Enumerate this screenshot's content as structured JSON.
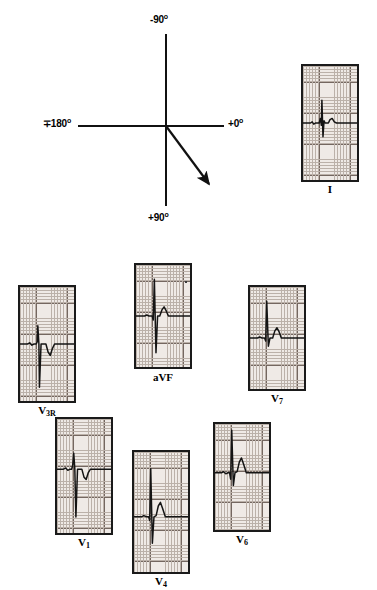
{
  "figure": {
    "type": "ecg-axis-diagram"
  },
  "axis_diagram": {
    "name": "hexaxial-reference-axes",
    "center": {
      "x": 166,
      "y": 126
    },
    "labels": [
      {
        "id": "top",
        "text": "-90",
        "degree_symbol": "o",
        "x": 150,
        "y": 14,
        "name": "axis-label-minus-90"
      },
      {
        "id": "left",
        "text": "∓180",
        "degree_symbol": "o",
        "x": 43,
        "y": 118,
        "name": "axis-label-plus-minus-180"
      },
      {
        "id": "right",
        "text": "+0",
        "degree_symbol": "o",
        "x": 228,
        "y": 118,
        "name": "axis-label-plus-0"
      },
      {
        "id": "bottom",
        "text": "+90",
        "degree_symbol": "o",
        "x": 148,
        "y": 212,
        "name": "axis-label-plus-90"
      }
    ],
    "vertical_axis": {
      "x": 165,
      "y_top": 34,
      "y_bottom": 206
    },
    "horizontal_axis": {
      "y": 125,
      "x_left": 78,
      "x_right": 224
    },
    "vector_arrow": {
      "name": "mean-qrs-axis-vector",
      "from": {
        "x": 166,
        "y": 126
      },
      "to": {
        "x": 214,
        "y": 191
      },
      "approx_degrees": 54
    }
  },
  "strips": [
    {
      "id": "lead-I",
      "label": "I",
      "label_sub": "",
      "box": {
        "x": 301,
        "y": 64,
        "w": 58,
        "h": 118
      },
      "label_pos": {
        "x": 301,
        "y": 183,
        "w": 58
      },
      "baseline_frac": 0.5,
      "morphology": "small-r-small-s, low amplitude, isoelectric",
      "trace": "M0,50 L14,50 L17,49 L20,51 L23,50 L30,50 L32,46 L34,52 L35,30 L37,62 L39,48 L41,50 L47,50 L50,47 L54,46 L58,49 L62,50 L100,50"
    },
    {
      "id": "lead-aVF",
      "label": "aVF",
      "label_sub": "",
      "box": {
        "x": 134,
        "y": 263,
        "w": 58,
        "h": 106
      },
      "label_pos": {
        "x": 134,
        "y": 371,
        "w": 58
      },
      "baseline_frac": 0.5,
      "morphology": "tall R with deep S, qRs pattern",
      "trace": "M0,50 L16,50 L20,49 L24,50 L30,50 L32,54 L34,14 L37,86 L40,50 L44,50 L48,44 L52,41 L56,45 L60,50 L100,50"
    },
    {
      "id": "lead-V3R",
      "label": "V",
      "label_sub": "3R",
      "box": {
        "x": 18,
        "y": 285,
        "w": 58,
        "h": 118
      },
      "label_pos": {
        "x": 18,
        "y": 404,
        "w": 58
      },
      "baseline_frac": 0.5,
      "morphology": "rS pattern with deep narrow S and inverted T",
      "trace": "M0,50 L14,50 L18,49 L22,51 L26,50 L30,50 L32,48 L33,34 L35,50 L36,88 L39,50 L43,50 L48,50 L52,57 L56,60 L60,54 L64,50 L100,50"
    },
    {
      "id": "lead-V7",
      "label": "V",
      "label_sub": "7",
      "box": {
        "x": 248,
        "y": 285,
        "w": 58,
        "h": 106
      },
      "label_pos": {
        "x": 248,
        "y": 392,
        "w": 58
      },
      "baseline_frac": 0.5,
      "morphology": "tall narrow R wave with upright T",
      "trace": "M0,50 L14,50 L18,49 L22,50 L27,50 L29,53 L31,14 L34,58 L37,50 L42,50 L46,43 L50,40 L54,44 L58,50 L100,50"
    },
    {
      "id": "lead-V1",
      "label": "V",
      "label_sub": "1",
      "box": {
        "x": 55,
        "y": 417,
        "w": 58,
        "h": 118
      },
      "label_pos": {
        "x": 55,
        "y": 536,
        "w": 58
      },
      "baseline_frac": 0.44,
      "morphology": "rS pattern, deep broad S wave, inverted T",
      "trace": "M0,50 L12,50 L16,49 L20,51 L24,50 L27,50 L29,47 L31,36 L33,50 L35,92 L38,50 L42,50 L46,50 L50,57 L54,59 L58,53 L62,50 L100,50"
    },
    {
      "id": "lead-V4",
      "label": "V",
      "label_sub": "4",
      "box": {
        "x": 132,
        "y": 450,
        "w": 58,
        "h": 124
      },
      "label_pos": {
        "x": 132,
        "y": 575,
        "w": 58
      },
      "baseline_frac": 0.54,
      "morphology": "tall R wave with S and prominent upright T",
      "trace": "M0,50 L14,50 L18,49 L23,50 L27,50 L29,53 L31,10 L34,72 L37,50 L41,49 L45,41 L49,38 L53,43 L58,50 L100,50"
    },
    {
      "id": "lead-V6",
      "label": "V",
      "label_sub": "6",
      "box": {
        "x": 213,
        "y": 422,
        "w": 58,
        "h": 110
      },
      "label_pos": {
        "x": 213,
        "y": 533,
        "w": 58
      },
      "baseline_frac": 0.46,
      "morphology": "tall R wave with small q and upright T",
      "trace": "M0,50 L12,50 L16,49 L20,51 L24,50 L27,50 L29,56 L31,10 L34,62 L37,50 L41,49 L45,40 L49,36 L53,42 L58,50 L100,50"
    }
  ],
  "grid_colors": {
    "paper": "#efeae6",
    "minor_line": "#b9aea6",
    "major_line": "#6e6059",
    "trace": "#141414",
    "border": "#1a1a1a"
  }
}
